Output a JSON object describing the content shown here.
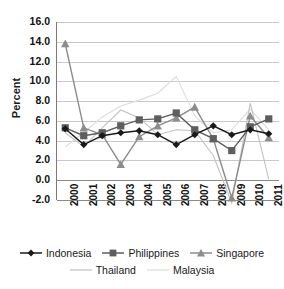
{
  "chart_data": {
    "type": "line",
    "title": "",
    "xlabel": "",
    "ylabel": "Percent",
    "ylim": [
      -2.0,
      16.0
    ],
    "yticks": [
      "16.0",
      "14.0",
      "12.0",
      "10.0",
      "8.0",
      "6.0",
      "4.0",
      "2.0",
      "0.0",
      "-2.0"
    ],
    "ytick_values": [
      16.0,
      14.0,
      12.0,
      10.0,
      8.0,
      6.0,
      4.0,
      2.0,
      0.0,
      -2.0
    ],
    "grid": true,
    "legend_position": "bottom",
    "categories": [
      "2000",
      "2001",
      "2002",
      "2003",
      "2004",
      "2005",
      "2006",
      "2007",
      "2008",
      "2009",
      "2010",
      "2011"
    ],
    "series": [
      {
        "name": "Indonesia",
        "marker": "diamond",
        "color": "#1a1a1a",
        "values": [
          5.2,
          3.6,
          4.5,
          4.8,
          5.0,
          4.6,
          3.6,
          4.6,
          5.5,
          4.6,
          5.1,
          4.7
        ]
      },
      {
        "name": "Philippines",
        "marker": "square",
        "color": "#5e5e5e",
        "values": [
          5.3,
          4.5,
          4.8,
          5.5,
          6.1,
          6.2,
          6.8,
          5.1,
          4.2,
          3.0,
          5.4,
          6.2
        ]
      },
      {
        "name": "Singapore",
        "marker": "triangle",
        "color": "#8c8c8c",
        "values": [
          13.8,
          5.3,
          4.6,
          1.6,
          4.4,
          5.5,
          6.3,
          7.4,
          4.2,
          -1.8,
          6.5,
          4.3
        ]
      },
      {
        "name": "Thailand",
        "marker": "none",
        "color": "#c2c2c2",
        "values": [
          4.8,
          3.4,
          5.3,
          7.1,
          6.3,
          4.6,
          5.1,
          5.0,
          2.5,
          -2.3,
          7.8,
          0.1
        ]
      },
      {
        "name": "Malaysia",
        "marker": "none",
        "color": "#dcdcdc",
        "values": [
          3.4,
          4.8,
          6.4,
          7.5,
          8.1,
          8.8,
          10.5,
          6.5,
          4.8,
          5.1,
          7.2,
          5.1
        ]
      }
    ]
  },
  "legend": {
    "row1": [
      {
        "label": "Indonesia",
        "marker": "diamond",
        "color": "#1a1a1a"
      },
      {
        "label": "Philippines",
        "marker": "square",
        "color": "#5e5e5e"
      },
      {
        "label": "Singapore",
        "marker": "triangle",
        "color": "#8c8c8c"
      }
    ],
    "row2": [
      {
        "label": "Thailand",
        "marker": "line",
        "color": "#c2c2c2"
      },
      {
        "label": "Malaysia",
        "marker": "line",
        "color": "#dcdcdc"
      }
    ]
  },
  "axis_title": {
    "y": "Percent"
  }
}
